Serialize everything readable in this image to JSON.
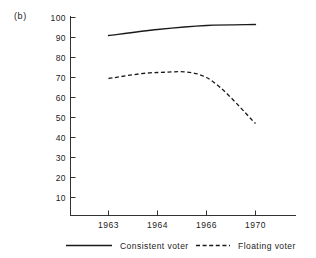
{
  "figure": {
    "panel_label": "(b)"
  },
  "chart_data": {
    "type": "line",
    "title": "",
    "subtitle": "",
    "xlabel": "",
    "ylabel": "",
    "categories": [
      "1963",
      "1964",
      "1966",
      "1970"
    ],
    "x_tick_labels": [
      "1963",
      "1964",
      "1966",
      "1970"
    ],
    "y_tick_labels": [
      "100",
      "90",
      "80",
      "70",
      "60",
      "50",
      "40",
      "30",
      "20",
      "10"
    ],
    "y_tick_values": [
      100,
      90,
      80,
      70,
      60,
      50,
      40,
      30,
      20,
      10
    ],
    "ylim": [
      0,
      100
    ],
    "grid": false,
    "legend_position": "bottom",
    "series": [
      {
        "name": "Consistent voter",
        "style": "solid",
        "color": "#1a1a1a",
        "values": [
          91,
          94,
          96,
          96.5
        ]
      },
      {
        "name": "Floating voter",
        "style": "dashed",
        "color": "#1a1a1a",
        "values": [
          69.5,
          72.5,
          70,
          47
        ]
      }
    ]
  },
  "legend": {
    "items": [
      {
        "label": "Consistent voter",
        "style": "solid"
      },
      {
        "label": "Floating voter",
        "style": "dashed"
      }
    ]
  }
}
